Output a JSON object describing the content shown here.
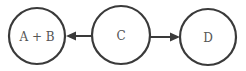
{
  "diagram": {
    "type": "directed-graph",
    "colors": {
      "stroke": "#3a3a3a",
      "label": "#555555",
      "background": "#ffffff"
    },
    "nodes": [
      {
        "id": "ab",
        "label": "A + B",
        "cx": 37,
        "cy": 36,
        "r": 28
      },
      {
        "id": "c",
        "label": "C",
        "cx": 121,
        "cy": 35,
        "r": 29
      },
      {
        "id": "d",
        "label": "D",
        "cx": 208,
        "cy": 37,
        "r": 28
      }
    ],
    "edges": [
      {
        "from": "C",
        "to": "A + B"
      },
      {
        "from": "C",
        "to": "D"
      }
    ]
  }
}
